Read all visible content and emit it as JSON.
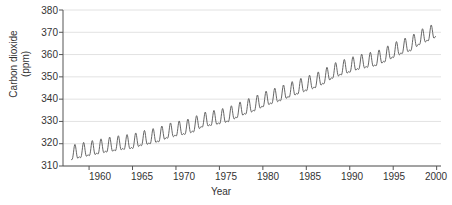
{
  "chart_data": {
    "type": "line",
    "title": "",
    "xlabel": "Year",
    "ylabel": "Carbon dioxide (ppm)",
    "ylabel_lines": [
      "Carbon dioxide",
      "(ppm)"
    ],
    "xlim": [
      1957,
      2000.5
    ],
    "ylim": [
      310,
      380
    ],
    "xticks": [
      1960,
      1965,
      1970,
      1975,
      1980,
      1985,
      1990,
      1995,
      2000
    ],
    "yticks": [
      310,
      320,
      330,
      340,
      350,
      360,
      370,
      380
    ],
    "grid": "horizontal",
    "legend": "none",
    "line_color": "#555555",
    "grid_color": "#e2e2e2",
    "axis_color": "#555555",
    "series": [
      {
        "name": "Atmospheric CO2 (Mauna Loa monthly mean)",
        "annual_trend": {
          "x": [
            1958,
            1959,
            1960,
            1961,
            1962,
            1963,
            1964,
            1965,
            1966,
            1967,
            1968,
            1969,
            1970,
            1971,
            1972,
            1973,
            1974,
            1975,
            1976,
            1977,
            1978,
            1979,
            1980,
            1981,
            1982,
            1983,
            1984,
            1985,
            1986,
            1987,
            1988,
            1989,
            1990,
            1991,
            1992,
            1993,
            1994,
            1995,
            1996,
            1997,
            1998,
            1999
          ],
          "values": [
            315.0,
            315.9,
            316.8,
            317.5,
            318.4,
            319.0,
            319.6,
            320.0,
            321.3,
            322.1,
            323.0,
            324.6,
            325.6,
            326.3,
            327.4,
            329.6,
            330.3,
            331.1,
            332.0,
            333.8,
            335.4,
            336.8,
            338.7,
            340.1,
            341.4,
            343.0,
            344.4,
            345.9,
            347.2,
            349.0,
            351.5,
            353.0,
            354.2,
            355.5,
            356.4,
            357.1,
            358.8,
            360.8,
            362.6,
            363.8,
            366.6,
            368.3
          ]
        },
        "seasonal_amplitude_ppm": 6.0,
        "seasonal_peak_month": "May",
        "seasonal_trough_month": "October"
      }
    ]
  },
  "axes": {
    "x_tick_labels": [
      "1960",
      "1965",
      "1970",
      "1975",
      "1980",
      "1985",
      "1990",
      "1995",
      "2000"
    ],
    "y_tick_labels": [
      "310",
      "320",
      "330",
      "340",
      "350",
      "360",
      "370",
      "380"
    ]
  }
}
